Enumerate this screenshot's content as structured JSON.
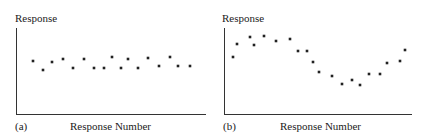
{
  "chart_data": [
    {
      "type": "scatter",
      "panel_label": "(a)",
      "title": "",
      "xlabel": "Response Number",
      "ylabel": "Response",
      "grid": false,
      "description": "Random scatter about a constant level",
      "x": [
        1,
        2,
        3,
        4,
        5,
        6,
        7,
        8,
        9,
        10,
        11,
        12,
        13,
        14,
        15,
        16,
        17
      ],
      "y": [
        0.62,
        0.51,
        0.6,
        0.64,
        0.53,
        0.64,
        0.53,
        0.53,
        0.66,
        0.53,
        0.64,
        0.53,
        0.65,
        0.56,
        0.66,
        0.56,
        0.56
      ],
      "ylim": [
        0,
        1
      ],
      "pixel_points": [
        [
          33,
          61
        ],
        [
          43,
          70
        ],
        [
          52,
          62
        ],
        [
          63,
          59
        ],
        [
          73,
          68
        ],
        [
          84,
          59
        ],
        [
          94,
          68
        ],
        [
          104,
          68
        ],
        [
          112,
          57
        ],
        [
          121,
          68
        ],
        [
          128,
          59
        ],
        [
          138,
          68
        ],
        [
          148,
          58
        ],
        [
          159,
          66
        ],
        [
          170,
          57
        ],
        [
          178,
          66
        ],
        [
          190,
          66
        ]
      ]
    },
    {
      "type": "scatter",
      "panel_label": "(b)",
      "title": "",
      "xlabel": "Response Number",
      "ylabel": "Response",
      "grid": false,
      "description": "Cyclic / wave-like pattern",
      "x": [
        1,
        2,
        3,
        4,
        5,
        6,
        7,
        8,
        9,
        10,
        11,
        12,
        13,
        14,
        15,
        16,
        17,
        18,
        19,
        20
      ],
      "y": [
        0.66,
        0.81,
        0.9,
        0.8,
        0.91,
        0.85,
        0.87,
        0.73,
        0.73,
        0.6,
        0.49,
        0.44,
        0.35,
        0.4,
        0.34,
        0.47,
        0.47,
        0.6,
        0.62,
        0.74
      ],
      "ylim": [
        0,
        1
      ],
      "pixel_points": [
        [
          233,
          57
        ],
        [
          237,
          44
        ],
        [
          250,
          37
        ],
        [
          254,
          45
        ],
        [
          264,
          36
        ],
        [
          276,
          41
        ],
        [
          290,
          39
        ],
        [
          298,
          51
        ],
        [
          307,
          51
        ],
        [
          313,
          62
        ],
        [
          319,
          72
        ],
        [
          332,
          76
        ],
        [
          342,
          84
        ],
        [
          352,
          80
        ],
        [
          360,
          85
        ],
        [
          369,
          74
        ],
        [
          380,
          74
        ],
        [
          387,
          63
        ],
        [
          400,
          61
        ],
        [
          405,
          50
        ]
      ]
    }
  ],
  "panels": [
    {
      "label": "(a)",
      "ylabel": "Response",
      "xlabel": "Response Number"
    },
    {
      "label": "(b)",
      "ylabel": "Response",
      "xlabel": "Response Number"
    }
  ],
  "colors": {
    "ink": "#222222",
    "background": "#ffffff"
  }
}
